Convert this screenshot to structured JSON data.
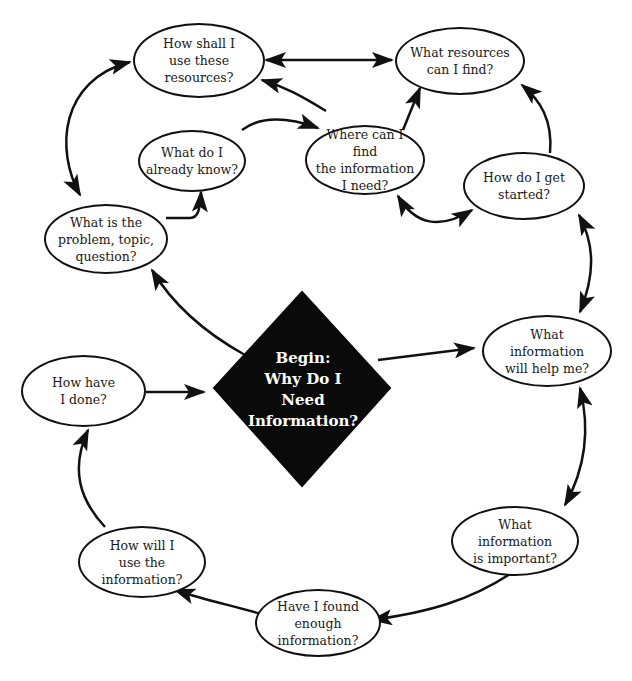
{
  "diagram": {
    "type": "cycle-flowchart",
    "center": {
      "label": "Begin:\nWhy Do I\nNeed\nInformation?",
      "shape": "diamond",
      "fill": "#0a0a0a",
      "text_color": "#ffffff"
    },
    "nodes": [
      {
        "id": "how-shall-i-use",
        "label": "How shall I\nuse these\nresources?"
      },
      {
        "id": "what-resources",
        "label": "What resources\ncan I find?"
      },
      {
        "id": "what-do-i-know",
        "label": "What do I\nalready know?"
      },
      {
        "id": "where-can-i-find",
        "label": "Where can I find\nthe information\nI need?"
      },
      {
        "id": "how-do-i-start",
        "label": "How do I get\nstarted?"
      },
      {
        "id": "what-is-problem",
        "label": "What is the\nproblem, topic,\nquestion?"
      },
      {
        "id": "what-info-help",
        "label": "What\ninformation\nwill help me?"
      },
      {
        "id": "how-have-i-done",
        "label": "How have\nI done?"
      },
      {
        "id": "what-info-important",
        "label": "What\ninformation\nis important?"
      },
      {
        "id": "found-enough",
        "label": "Have I found\nenough\ninformation?"
      },
      {
        "id": "how-will-i-use",
        "label": "How will I\nuse the\ninformation?"
      }
    ],
    "edges": [
      {
        "from": "how-shall-i-use",
        "to": "what-resources",
        "bidirectional": true
      },
      {
        "from": "what-is-problem",
        "to": "how-shall-i-use",
        "bidirectional": true
      },
      {
        "from": "what-is-problem",
        "to": "what-do-i-know",
        "bidirectional": false
      },
      {
        "from": "what-do-i-know",
        "to": "where-can-i-find",
        "bidirectional": false
      },
      {
        "from": "where-can-i-find",
        "to": "how-shall-i-use",
        "bidirectional": false
      },
      {
        "from": "where-can-i-find",
        "to": "what-resources",
        "bidirectional": false
      },
      {
        "from": "how-do-i-start",
        "to": "what-resources",
        "bidirectional": false
      },
      {
        "from": "where-can-i-find",
        "to": "how-do-i-start",
        "bidirectional": true
      },
      {
        "from": "how-do-i-start",
        "to": "what-info-help",
        "bidirectional": true
      },
      {
        "from": "center",
        "to": "what-is-problem",
        "bidirectional": false
      },
      {
        "from": "center",
        "to": "what-info-help",
        "bidirectional": false
      },
      {
        "from": "how-have-i-done",
        "to": "center",
        "bidirectional": false
      },
      {
        "from": "what-info-help",
        "to": "what-info-important",
        "bidirectional": true
      },
      {
        "from": "what-info-important",
        "to": "found-enough",
        "bidirectional": false
      },
      {
        "from": "found-enough",
        "to": "how-will-i-use",
        "bidirectional": false
      },
      {
        "from": "how-will-i-use",
        "to": "how-have-i-done",
        "bidirectional": false
      }
    ],
    "colors": {
      "stroke": "#111111",
      "node_fill": "#ffffff",
      "background": "#ffffff"
    }
  }
}
